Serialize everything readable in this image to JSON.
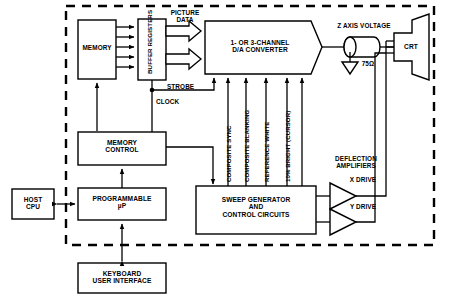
{
  "diagram": {
    "enclosure": {
      "style": "dashed",
      "note": "display controller boundary"
    },
    "blocks": {
      "memory": "MEMORY",
      "buffer_registers": "BUFFER\nREGISTERS",
      "da_converter": "1- OR 3-CHANNEL\nD/A CONVERTER",
      "memory_control": "MEMORY\nCONTROL",
      "programmable_up": "PROGRAMMABLE\nµP",
      "host_cpu": "HOST\nCPU",
      "keyboard": "KEYBOARD\nUSER INTERFACE",
      "sweep_generator": "SWEEP GENERATOR\nAND\nCONTROL CIRCUITS",
      "crt": "CRT"
    },
    "signal_labels": {
      "picture_data": "PICTURE\nDATA",
      "strobe": "STROBE",
      "clock": "CLOCK",
      "z_axis_voltage": "Z AXIS VOLTAGE",
      "resistor": "75Ω",
      "deflection_amplifiers": "DEFLECTION\nAMPLIFIERS",
      "x_drive": "X DRIVE",
      "y_drive": "Y DRIVE"
    },
    "vertical_signals": [
      "COMPOSITE SYNC",
      "COMPOSITE BLANKING",
      "REFERENCE WHITE",
      "10% BRIGHT (CURSOR)"
    ],
    "colors": {
      "line": "#000000",
      "background": "#ffffff",
      "fill": "#ffffff"
    }
  }
}
